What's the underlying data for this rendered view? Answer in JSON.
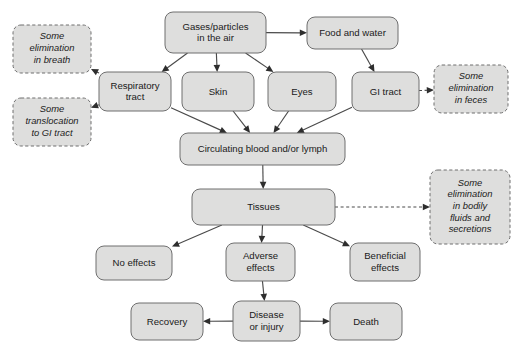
{
  "diagram": {
    "colors": {
      "node_fill": "#dededd",
      "node_stroke": "#6f6f6f",
      "edge": "#4a4a4a",
      "background": "#ffffff",
      "text": "#1a1a1a"
    },
    "nodes": [
      {
        "id": "gases",
        "label_lines": [
          "Gases/particles",
          "in the air"
        ],
        "style": "solid",
        "x": 165,
        "y": 12,
        "w": 101,
        "h": 41
      },
      {
        "id": "food",
        "label_lines": [
          "Food and water"
        ],
        "style": "solid",
        "x": 307,
        "y": 17,
        "w": 91,
        "h": 32
      },
      {
        "id": "respiratory",
        "label_lines": [
          "Respiratory",
          "tract"
        ],
        "style": "solid",
        "x": 99,
        "y": 72,
        "w": 72,
        "h": 39
      },
      {
        "id": "skin",
        "label_lines": [
          "Skin"
        ],
        "style": "solid",
        "x": 182,
        "y": 72,
        "w": 72,
        "h": 39
      },
      {
        "id": "eyes",
        "label_lines": [
          "Eyes"
        ],
        "style": "solid",
        "x": 268,
        "y": 72,
        "w": 68,
        "h": 39
      },
      {
        "id": "gitract",
        "label_lines": [
          "GI tract"
        ],
        "style": "solid",
        "x": 352,
        "y": 72,
        "w": 67,
        "h": 39
      },
      {
        "id": "breath",
        "label_lines": [
          "Some",
          "elimination",
          "in breath"
        ],
        "style": "dashed",
        "x": 13,
        "y": 25,
        "w": 78,
        "h": 48
      },
      {
        "id": "translocation",
        "label_lines": [
          "Some",
          "translocation",
          "to GI tract"
        ],
        "style": "dashed",
        "x": 13,
        "y": 98,
        "w": 78,
        "h": 48
      },
      {
        "id": "feces",
        "label_lines": [
          "Some",
          "elimination",
          "in feces"
        ],
        "style": "dashed",
        "x": 434,
        "y": 65,
        "w": 74,
        "h": 48
      },
      {
        "id": "bodily",
        "label_lines": [
          "Some",
          "elimination",
          "in bodily",
          "fluids and",
          "secretions"
        ],
        "style": "dashed",
        "x": 430,
        "y": 170,
        "w": 80,
        "h": 74
      },
      {
        "id": "circulating",
        "label_lines": [
          "Circulating blood and/or lymph"
        ],
        "style": "solid",
        "x": 180,
        "y": 133,
        "w": 165,
        "h": 32
      },
      {
        "id": "tissues",
        "label_lines": [
          "Tissues"
        ],
        "style": "solid",
        "x": 192,
        "y": 189,
        "w": 143,
        "h": 36
      },
      {
        "id": "noeffects",
        "label_lines": [
          "No effects"
        ],
        "style": "solid",
        "x": 96,
        "y": 246,
        "w": 76,
        "h": 34
      },
      {
        "id": "adverse",
        "label_lines": [
          "Adverse",
          "effects"
        ],
        "style": "solid",
        "x": 226,
        "y": 243,
        "w": 69,
        "h": 38
      },
      {
        "id": "beneficial",
        "label_lines": [
          "Beneficial",
          "effects"
        ],
        "style": "solid",
        "x": 350,
        "y": 243,
        "w": 70,
        "h": 38
      },
      {
        "id": "recovery",
        "label_lines": [
          "Recovery"
        ],
        "style": "solid",
        "x": 131,
        "y": 303,
        "w": 72,
        "h": 37
      },
      {
        "id": "disease",
        "label_lines": [
          "Disease",
          "or injury"
        ],
        "style": "solid",
        "x": 233,
        "y": 301,
        "w": 67,
        "h": 40
      },
      {
        "id": "death",
        "label_lines": [
          "Death"
        ],
        "style": "solid",
        "x": 330,
        "y": 303,
        "w": 72,
        "h": 37
      }
    ],
    "edges": [
      {
        "from": "gases",
        "to": "food",
        "style": "solid"
      },
      {
        "from": "gases",
        "to": "respiratory",
        "style": "solid"
      },
      {
        "from": "gases",
        "to": "skin",
        "style": "solid"
      },
      {
        "from": "gases",
        "to": "eyes",
        "style": "solid"
      },
      {
        "from": "food",
        "to": "gitract",
        "style": "solid"
      },
      {
        "from": "respiratory",
        "to": "breath",
        "style": "dashed"
      },
      {
        "from": "respiratory",
        "to": "translocation",
        "style": "dashed"
      },
      {
        "from": "respiratory",
        "to": "circulating",
        "style": "solid"
      },
      {
        "from": "skin",
        "to": "circulating",
        "style": "solid"
      },
      {
        "from": "eyes",
        "to": "circulating",
        "style": "solid"
      },
      {
        "from": "gitract",
        "to": "feces",
        "style": "dashed"
      },
      {
        "from": "gitract",
        "to": "circulating",
        "style": "solid"
      },
      {
        "from": "circulating",
        "to": "tissues",
        "style": "solid"
      },
      {
        "from": "tissues",
        "to": "bodily",
        "style": "dashed"
      },
      {
        "from": "tissues",
        "to": "noeffects",
        "style": "solid"
      },
      {
        "from": "tissues",
        "to": "adverse",
        "style": "solid"
      },
      {
        "from": "tissues",
        "to": "beneficial",
        "style": "solid"
      },
      {
        "from": "adverse",
        "to": "disease",
        "style": "solid"
      },
      {
        "from": "disease",
        "to": "recovery",
        "style": "solid"
      },
      {
        "from": "disease",
        "to": "death",
        "style": "solid"
      }
    ]
  }
}
